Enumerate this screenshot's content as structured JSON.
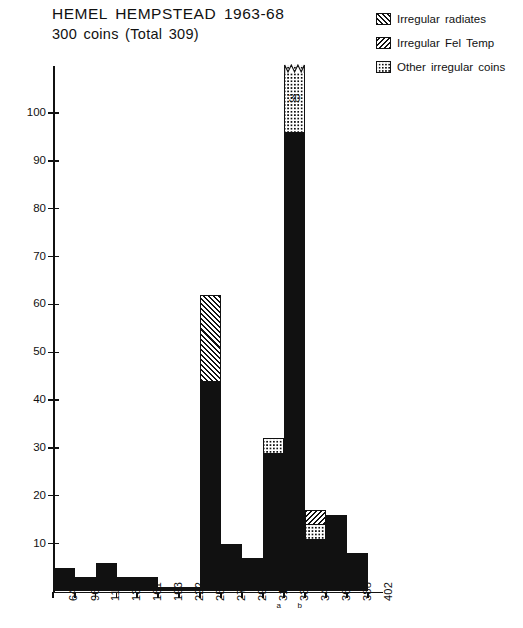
{
  "title": {
    "main": "HEMEL HEMPSTEAD  1963-68",
    "sub": "300 coins  (Total 309)"
  },
  "legend": {
    "items": [
      {
        "key": "radiates",
        "label": "Irregular radiates"
      },
      {
        "key": "feltemp",
        "label": "Irregular Fel Temp"
      },
      {
        "key": "other",
        "label": "Other irregular coins"
      }
    ]
  },
  "axes": {
    "y_ticks": [
      "10",
      "20",
      "30",
      "40",
      "50",
      "60",
      "70",
      "80",
      "90",
      "100"
    ],
    "y_values": [
      10,
      20,
      30,
      40,
      50,
      60,
      70,
      80,
      90,
      100
    ],
    "y_max_drawn": 110,
    "x_labels": [
      "64",
      "96",
      "117",
      "138",
      "161",
      "193",
      "222",
      "259",
      "275",
      "296",
      "317",
      "330",
      "348",
      "364",
      "388",
      "402"
    ],
    "x_sub_labels": [
      {
        "text": "a",
        "between": [
          "317",
          "330"
        ]
      },
      {
        "text": "b",
        "between": [
          "330",
          "348"
        ]
      }
    ]
  },
  "annotations": {
    "broken_bar_value": "30",
    "broken_bar_period": "330"
  },
  "colors": {
    "ink": "#111111",
    "paper": "#ffffff"
  },
  "chart_data": {
    "type": "bar",
    "title": "HEMEL HEMPSTEAD  1963-68",
    "subtitle": "300 coins  (Total 309)",
    "xlabel": "",
    "ylabel": "",
    "ylim": [
      0,
      110
    ],
    "grid": false,
    "legend_position": "top-right",
    "note": "Stacked histogram of Roman coin finds by issue period (start date of period on x-axis). The 330 bar exceeds the axis maximum and is drawn with a zigzag break; its dotted 'other irregular coins' segment is labelled 30.",
    "categories": [
      "64",
      "96",
      "117",
      "138",
      "161",
      "193",
      "222",
      "259",
      "275",
      "296",
      "317",
      "330",
      "348",
      "364",
      "388",
      "402"
    ],
    "series": [
      {
        "name": "Regular coins",
        "key": "solid",
        "values": [
          5,
          3,
          6,
          3,
          3,
          1,
          1,
          44,
          10,
          7,
          29,
          96,
          11,
          16,
          8,
          0
        ]
      },
      {
        "name": "Other irregular coins",
        "key": "other",
        "values": [
          0,
          0,
          0,
          0,
          0,
          0,
          0,
          0,
          0,
          0,
          3,
          30,
          3,
          0,
          0,
          0
        ]
      },
      {
        "name": "Irregular Fel Temp",
        "key": "feltemp",
        "values": [
          0,
          0,
          0,
          0,
          0,
          0,
          0,
          0,
          0,
          0,
          0,
          0,
          3,
          0,
          0,
          0
        ]
      },
      {
        "name": "Irregular radiates",
        "key": "radiates",
        "values": [
          0,
          0,
          0,
          0,
          0,
          0,
          0,
          18,
          0,
          0,
          0,
          0,
          0,
          0,
          0,
          0
        ]
      }
    ],
    "totals": [
      5,
      3,
      6,
      3,
      3,
      1,
      1,
      62,
      10,
      7,
      32,
      126,
      17,
      16,
      8,
      0
    ]
  },
  "bars": [
    {
      "label": "64",
      "x": 53,
      "w": 22.0,
      "segments": [
        {
          "type": "solid",
          "from": 0,
          "to": 5
        }
      ]
    },
    {
      "label": "96",
      "x": 75.0,
      "w": 20.5,
      "segments": [
        {
          "type": "solid",
          "from": 0,
          "to": 3
        }
      ]
    },
    {
      "label": "117",
      "x": 95.5,
      "w": 21.0,
      "segments": [
        {
          "type": "solid",
          "from": 0,
          "to": 6
        }
      ]
    },
    {
      "label": "138",
      "x": 116.5,
      "w": 20.5,
      "segments": [
        {
          "type": "solid",
          "from": 0,
          "to": 3
        }
      ]
    },
    {
      "label": "161",
      "x": 137.0,
      "w": 21.0,
      "segments": [
        {
          "type": "solid",
          "from": 0,
          "to": 3
        }
      ]
    },
    {
      "label": "193",
      "x": 158.0,
      "w": 21.0,
      "segments": [
        {
          "type": "solid",
          "from": 0,
          "to": 1
        }
      ]
    },
    {
      "label": "222",
      "x": 179.0,
      "w": 21.0,
      "segments": [
        {
          "type": "solid",
          "from": 0,
          "to": 1
        }
      ]
    },
    {
      "label": "259",
      "x": 200.0,
      "w": 21.0,
      "segments": [
        {
          "type": "solid",
          "from": 0,
          "to": 44
        },
        {
          "type": "radiates",
          "from": 44,
          "to": 62
        }
      ]
    },
    {
      "label": "275",
      "x": 221.0,
      "w": 21.0,
      "segments": [
        {
          "type": "solid",
          "from": 0,
          "to": 10
        }
      ]
    },
    {
      "label": "296",
      "x": 242.0,
      "w": 21.0,
      "segments": [
        {
          "type": "solid",
          "from": 0,
          "to": 7
        }
      ]
    },
    {
      "label": "317",
      "x": 263.0,
      "w": 21.0,
      "segments": [
        {
          "type": "solid",
          "from": 0,
          "to": 29
        },
        {
          "type": "other",
          "from": 29,
          "to": 32
        }
      ]
    },
    {
      "label": "330",
      "x": 284.0,
      "w": 21.0,
      "segments": [
        {
          "type": "solid",
          "from": 0,
          "to": 96
        },
        {
          "type": "other",
          "from": 96,
          "to": 110
        }
      ],
      "broken": true
    },
    {
      "label": "348",
      "x": 305.0,
      "w": 21.0,
      "segments": [
        {
          "type": "solid",
          "from": 0,
          "to": 11
        },
        {
          "type": "other",
          "from": 11,
          "to": 14
        },
        {
          "type": "feltemp",
          "from": 14,
          "to": 17
        }
      ]
    },
    {
      "label": "364",
      "x": 326.0,
      "w": 21.0,
      "segments": [
        {
          "type": "solid",
          "from": 0,
          "to": 16
        }
      ]
    },
    {
      "label": "388",
      "x": 347.0,
      "w": 21.0,
      "segments": [
        {
          "type": "solid",
          "from": 0,
          "to": 8
        }
      ]
    }
  ]
}
